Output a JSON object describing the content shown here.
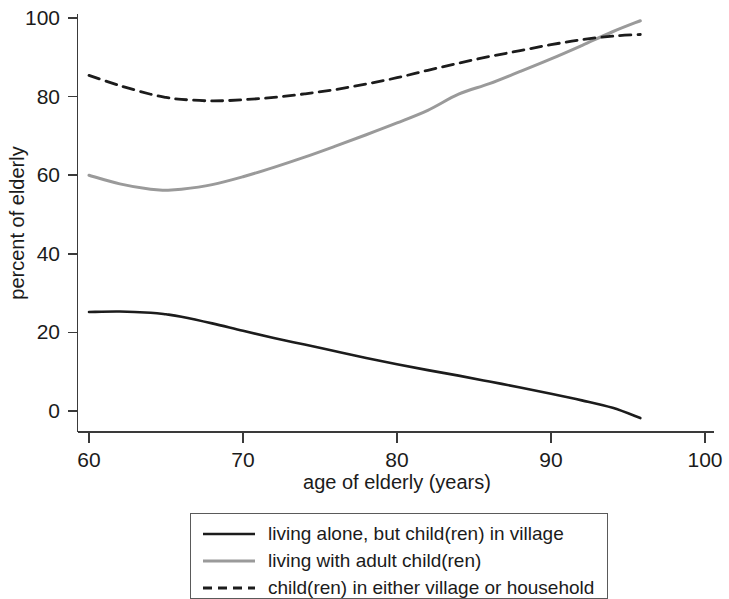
{
  "chart_data": {
    "type": "line",
    "title": "",
    "xlabel": "age of elderly (years)",
    "ylabel": "percent of elderly",
    "xlim": [
      58,
      102
    ],
    "ylim": [
      -5,
      103
    ],
    "xticks": [
      60,
      70,
      80,
      90,
      100
    ],
    "xtick_labels": [
      "60",
      "70",
      "80",
      "90",
      "100"
    ],
    "yticks": [
      0,
      20,
      40,
      60,
      80,
      100
    ],
    "ytick_labels": [
      "0",
      "20",
      "40",
      "60",
      "80",
      "100"
    ],
    "grid": false,
    "legend_position": "below-center",
    "x": [
      60,
      62,
      64,
      65,
      66,
      68,
      70,
      72,
      74,
      76,
      78,
      80,
      82,
      84,
      86,
      88,
      90,
      92,
      94,
      95.8
    ],
    "series": [
      {
        "name": "living alone, but child(ren) in village",
        "label": "living alone, but child(ren) in village",
        "style": "solid",
        "color": "#1c1c1c",
        "width": 2.6,
        "values": [
          25.2,
          25.3,
          25.0,
          24.6,
          24.0,
          22.3,
          20.4,
          18.6,
          16.9,
          15.2,
          13.5,
          11.9,
          10.4,
          9.0,
          7.5,
          6.0,
          4.4,
          2.7,
          0.8,
          -1.8
        ]
      },
      {
        "name": "living with adult child(ren)",
        "label": "living with adult child(ren)",
        "style": "solid",
        "color": "#9a9a9a",
        "width": 3.0,
        "values": [
          60.0,
          57.8,
          56.4,
          56.2,
          56.4,
          57.6,
          59.6,
          62.0,
          64.6,
          67.4,
          70.3,
          73.3,
          76.5,
          80.6,
          83.3,
          86.4,
          89.6,
          93.0,
          96.5,
          99.3
        ]
      },
      {
        "name": "child(ren) in either village or household",
        "label": "child(ren) in either village or household",
        "style": "dashed",
        "color": "#1c1c1c",
        "width": 2.8,
        "values": [
          85.4,
          82.8,
          80.6,
          79.8,
          79.3,
          78.9,
          79.2,
          79.8,
          80.7,
          81.8,
          83.2,
          84.8,
          86.7,
          88.5,
          90.2,
          91.7,
          93.2,
          94.5,
          95.4,
          95.8
        ]
      }
    ]
  },
  "legend": {
    "entries": [
      {
        "label": "living alone, but child(ren) in village",
        "style": "solid",
        "color": "#1c1c1c"
      },
      {
        "label": "living with adult child(ren)",
        "style": "solid",
        "color": "#9a9a9a"
      },
      {
        "label": "child(ren) in either village or household",
        "style": "dashed",
        "color": "#1c1c1c"
      }
    ]
  }
}
